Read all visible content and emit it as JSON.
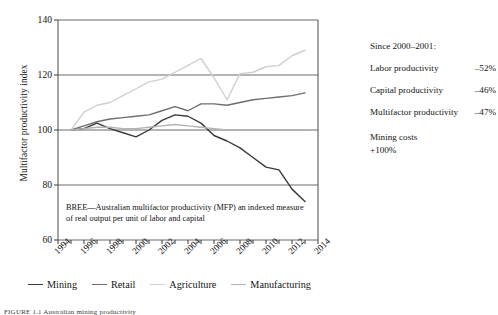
{
  "chart_data": {
    "type": "line",
    "title": "",
    "xlabel": "",
    "ylabel": "Multifactor productivity index",
    "xlim": [
      1994,
      2014
    ],
    "ylim": [
      60,
      140
    ],
    "yticks": [
      60,
      80,
      100,
      120,
      140
    ],
    "xticks": [
      1994,
      1996,
      1998,
      2000,
      2002,
      2004,
      2006,
      2008,
      2010,
      2012,
      2014
    ],
    "grid": "horizontal",
    "legend_position": "bottom",
    "x": [
      1995,
      1996,
      1997,
      1998,
      1999,
      2000,
      2001,
      2002,
      2003,
      2004,
      2005,
      2006,
      2007,
      2008,
      2009,
      2010,
      2011,
      2012,
      2013
    ],
    "series": [
      {
        "name": "Mining",
        "color": "#3a3a3a",
        "values": [
          100,
          100.5,
          102.5,
          100.5,
          99.0,
          97.5,
          100.0,
          103.5,
          105.5,
          105.0,
          102.5,
          98.0,
          96.0,
          93.5,
          90.0,
          86.5,
          85.5,
          78.5,
          74.0
        ]
      },
      {
        "name": "Retail",
        "color": "#6e6e6e",
        "values": [
          100,
          101.5,
          103.0,
          104.0,
          104.5,
          105.0,
          105.5,
          107.0,
          108.5,
          107.0,
          109.5,
          109.5,
          109.0,
          110.0,
          111.0,
          111.5,
          112.0,
          112.5,
          113.5
        ]
      },
      {
        "name": "Agriculture",
        "color": "#cfcfcf",
        "values": [
          100,
          106.5,
          109.0,
          110.0,
          112.5,
          115.0,
          117.5,
          118.5,
          121.0,
          123.5,
          126.0,
          119.0,
          111.0,
          120.5,
          121.0,
          123.0,
          123.5,
          127.0,
          129.0
        ]
      },
      {
        "name": "Manufacturing",
        "color": "#b3b3b3",
        "values": [
          100,
          100.5,
          101.0,
          101.0,
          100.5,
          100.5,
          101.0,
          101.5,
          102.0,
          101.5,
          101.0,
          100.5,
          100.0,
          100.0,
          100.0,
          100.0,
          100.0,
          100.0,
          100.0
        ]
      }
    ],
    "annotation": "BREE—Australian multifactor productivity (MFP) an indexed measure of real output per unit of labor and capital"
  },
  "side_panel": {
    "title": "Since 2000–2001:",
    "rows": [
      {
        "label": "Labor productivity",
        "value": "–52%"
      },
      {
        "label": "Capital productivity",
        "value": "–46%"
      },
      {
        "label": "Multifactor productivity",
        "value": "–47%"
      }
    ],
    "block": [
      "Mining costs",
      "+100%"
    ]
  },
  "caption": "FIGURE 1.1  Australian mining productivity"
}
